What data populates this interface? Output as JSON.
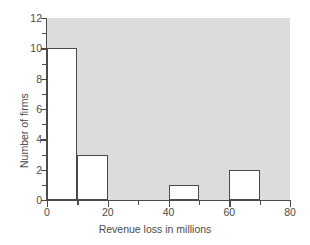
{
  "chart_data": {
    "type": "bar",
    "title": "",
    "xlabel": "Revenue loss in millions",
    "ylabel": "Number of firms",
    "xlim": [
      0,
      80
    ],
    "ylim": [
      0,
      12
    ],
    "grid": false,
    "legend": false,
    "bin_width": 10,
    "bin_edges": [
      0,
      10,
      20,
      30,
      40,
      50,
      60,
      70,
      80
    ],
    "categories": [
      "0-10",
      "10-20",
      "20-30",
      "30-40",
      "40-50",
      "50-60",
      "60-70",
      "70-80"
    ],
    "values": [
      10,
      3,
      0,
      0,
      1,
      0,
      2,
      0
    ],
    "bars": [
      {
        "x0": 0,
        "x1": 10,
        "height": 10
      },
      {
        "x0": 10,
        "x1": 20,
        "height": 3
      },
      {
        "x0": 40,
        "x1": 50,
        "height": 1
      },
      {
        "x0": 60,
        "x1": 70,
        "height": 2
      }
    ],
    "x_ticks_major": [
      0,
      20,
      40,
      60,
      80
    ],
    "x_ticks_minor": [
      10,
      30,
      50,
      70
    ],
    "y_ticks_major": [
      0,
      2,
      4,
      6,
      8,
      10,
      12
    ],
    "y_ticks_minor": [
      1,
      3,
      5,
      7,
      9,
      11
    ],
    "x_tick_labels": [
      "0",
      "20",
      "40",
      "60",
      "80"
    ],
    "y_tick_labels": [
      "0",
      "2",
      "4",
      "6",
      "8",
      "10",
      "12"
    ],
    "colors": {
      "plot_background": "#dcdcdc",
      "bar_fill": "#ffffff",
      "bar_outline": "#4a4a4a",
      "axis": "#4a4a4a",
      "text": "#4a4a4a",
      "page_background": "#ffffff"
    }
  },
  "axis": {
    "x_title": "Revenue loss in millions",
    "y_title": "Number of firms"
  }
}
